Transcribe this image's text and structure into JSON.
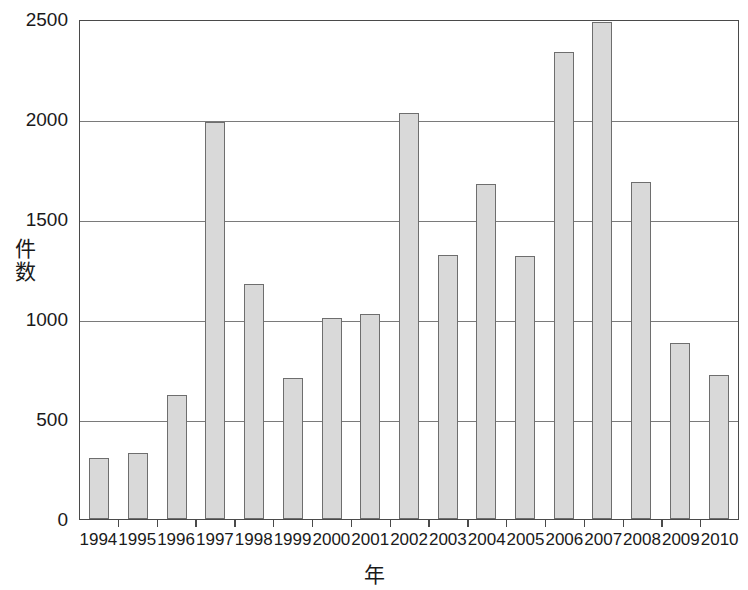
{
  "chart_data": {
    "type": "bar",
    "title": "",
    "xlabel": "年",
    "ylabel": "件数",
    "categories": [
      "1994",
      "1995",
      "1996",
      "1997",
      "1998",
      "1999",
      "2000",
      "2001",
      "2002",
      "2003",
      "2004",
      "2005",
      "2006",
      "2007",
      "2008",
      "2009",
      "2010"
    ],
    "values": [
      305,
      330,
      620,
      1985,
      1175,
      705,
      1005,
      1025,
      2030,
      1320,
      1675,
      1315,
      2335,
      2485,
      1685,
      880,
      720
    ],
    "ylim": [
      0,
      2500
    ],
    "yticks": [
      0,
      500,
      1000,
      1500,
      2000,
      2500
    ],
    "ytick_labels": [
      "0",
      "500",
      "1000",
      "1500",
      "2000",
      "2500"
    ],
    "grid": "horizontal",
    "legend": "none",
    "bar_fill_color": "#d9d9d9",
    "bar_border_color": "#6e6e6e",
    "axis_color": "#4a4a4a",
    "grid_color": "#7a7a7a",
    "background_color": "#ffffff"
  },
  "axis_titles": {
    "y_chars": [
      "件",
      "数"
    ],
    "x": "年"
  }
}
